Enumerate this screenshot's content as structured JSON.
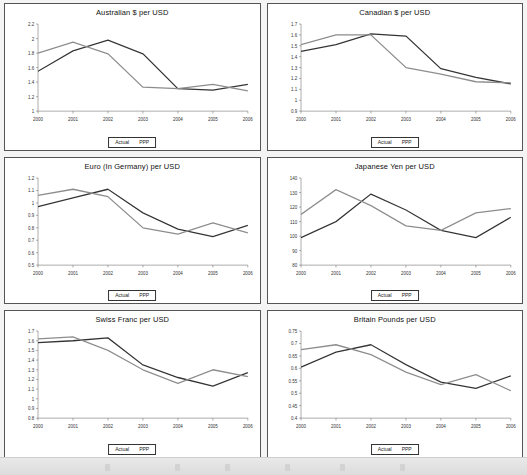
{
  "page": {
    "background_color": "#f4f4f4",
    "panel_border_color": "#555555",
    "actual_color": "#333333",
    "ppp_color": "#8c8c8c"
  },
  "legend": {
    "actual_label": "Actual",
    "ppp_label": "PPP"
  },
  "charts": [
    {
      "id": "australian-dollar",
      "chart_data": {
        "type": "line",
        "title": "Australian $ per USD",
        "xlabel": "",
        "ylabel": "",
        "categories": [
          "2000",
          "2001",
          "2002",
          "2003",
          "2004",
          "2005",
          "2006"
        ],
        "ylim": [
          1,
          2.2
        ],
        "yticks": [
          1,
          1.2,
          1.4,
          1.6,
          1.8,
          2,
          2.2
        ],
        "ytick_labels": [
          "1",
          "1.2",
          "1.4",
          "1.6",
          "1.8",
          "2",
          "2.2"
        ],
        "grid": false,
        "legend_position": "bottom",
        "series": [
          {
            "name": "Actual",
            "values": [
              1.55,
              1.83,
              1.98,
              1.79,
              1.31,
              1.29,
              1.37
            ]
          },
          {
            "name": "PPP",
            "values": [
              1.8,
              1.95,
              1.79,
              1.33,
              1.31,
              1.37,
              1.28
            ]
          }
        ]
      }
    },
    {
      "id": "canadian-dollar",
      "chart_data": {
        "type": "line",
        "title": "Canadian $ per USD",
        "xlabel": "",
        "ylabel": "",
        "categories": [
          "2000",
          "2001",
          "2002",
          "2003",
          "2004",
          "2005",
          "2006"
        ],
        "ylim": [
          0.9,
          1.7
        ],
        "yticks": [
          0.9,
          1,
          1.1,
          1.2,
          1.3,
          1.4,
          1.5,
          1.6,
          1.7
        ],
        "ytick_labels": [
          "0.9",
          "1",
          "1.1",
          "1.2",
          "1.3",
          "1.4",
          "1.5",
          "1.6",
          "1.7"
        ],
        "grid": false,
        "legend_position": "bottom",
        "series": [
          {
            "name": "Actual",
            "values": [
              1.45,
              1.51,
              1.61,
              1.59,
              1.29,
              1.21,
              1.15
            ]
          },
          {
            "name": "PPP",
            "values": [
              1.51,
              1.6,
              1.6,
              1.3,
              1.24,
              1.17,
              1.16
            ]
          }
        ]
      }
    },
    {
      "id": "euro-germany",
      "chart_data": {
        "type": "line",
        "title": "Euro (In Germany) per USD",
        "xlabel": "",
        "ylabel": "",
        "categories": [
          "2000",
          "2001",
          "2002",
          "2003",
          "2004",
          "2005",
          "2006"
        ],
        "ylim": [
          0.5,
          1.2
        ],
        "yticks": [
          0.5,
          0.6,
          0.7,
          0.8,
          0.9,
          1,
          1.1,
          1.2
        ],
        "ytick_labels": [
          "0.5",
          "0.6",
          "0.7",
          "0.8",
          "0.9",
          "1",
          "1.1",
          "1.2"
        ],
        "grid": false,
        "legend_position": "bottom",
        "series": [
          {
            "name": "Actual",
            "values": [
              0.97,
              1.04,
              1.11,
              0.92,
              0.79,
              0.73,
              0.82
            ]
          },
          {
            "name": "PPP",
            "values": [
              1.06,
              1.11,
              1.05,
              0.8,
              0.75,
              0.84,
              0.76
            ]
          }
        ]
      }
    },
    {
      "id": "japanese-yen",
      "chart_data": {
        "type": "line",
        "title": "Japanese Yen per USD",
        "xlabel": "",
        "ylabel": "",
        "categories": [
          "2000",
          "2001",
          "2002",
          "2003",
          "2004",
          "2005",
          "2006"
        ],
        "ylim": [
          80,
          140
        ],
        "yticks": [
          80,
          90,
          100,
          110,
          120,
          130,
          140
        ],
        "ytick_labels": [
          "80",
          "90",
          "100",
          "110",
          "120",
          "130",
          "140"
        ],
        "grid": false,
        "legend_position": "bottom",
        "series": [
          {
            "name": "Actual",
            "values": [
              99,
              110,
              129,
              118,
              104,
              99,
              113
            ]
          },
          {
            "name": "PPP",
            "values": [
              115,
              132,
              121,
              107,
              104,
              116,
              119
            ]
          }
        ]
      }
    },
    {
      "id": "swiss-franc",
      "chart_data": {
        "type": "line",
        "title": "Swiss Franc per USD",
        "xlabel": "",
        "ylabel": "",
        "categories": [
          "2000",
          "2001",
          "2002",
          "2003",
          "2004",
          "2005",
          "2006"
        ],
        "ylim": [
          0.8,
          1.7
        ],
        "yticks": [
          0.8,
          0.9,
          1,
          1.1,
          1.2,
          1.3,
          1.4,
          1.5,
          1.6,
          1.7
        ],
        "ytick_labels": [
          "0.8",
          "0.9",
          "1",
          "1.1",
          "1.2",
          "1.3",
          "1.4",
          "1.5",
          "1.6",
          "1.7"
        ],
        "grid": false,
        "legend_position": "bottom",
        "series": [
          {
            "name": "Actual",
            "values": [
              1.58,
              1.6,
              1.63,
              1.35,
              1.22,
              1.13,
              1.27
            ]
          },
          {
            "name": "PPP",
            "values": [
              1.62,
              1.64,
              1.5,
              1.3,
              1.16,
              1.3,
              1.23
            ]
          }
        ]
      }
    },
    {
      "id": "britain-pounds",
      "chart_data": {
        "type": "line",
        "title": "Britain Pounds per USD",
        "xlabel": "",
        "ylabel": "",
        "categories": [
          "2000",
          "2001",
          "2002",
          "2003",
          "2004",
          "2005",
          "2006"
        ],
        "ylim": [
          0.4,
          0.75
        ],
        "yticks": [
          0.4,
          0.45,
          0.5,
          0.55,
          0.6,
          0.65,
          0.7,
          0.75
        ],
        "ytick_labels": [
          "0.4",
          "0.45",
          "0.5",
          "0.55",
          "0.6",
          "0.65",
          "0.7",
          "0.75"
        ],
        "grid": false,
        "legend_position": "bottom",
        "series": [
          {
            "name": "Actual",
            "values": [
              0.605,
              0.665,
              0.695,
              0.615,
              0.545,
              0.52,
              0.57
            ]
          },
          {
            "name": "PPP",
            "values": [
              0.675,
              0.695,
              0.655,
              0.585,
              0.535,
              0.575,
              0.51
            ]
          }
        ]
      }
    }
  ]
}
